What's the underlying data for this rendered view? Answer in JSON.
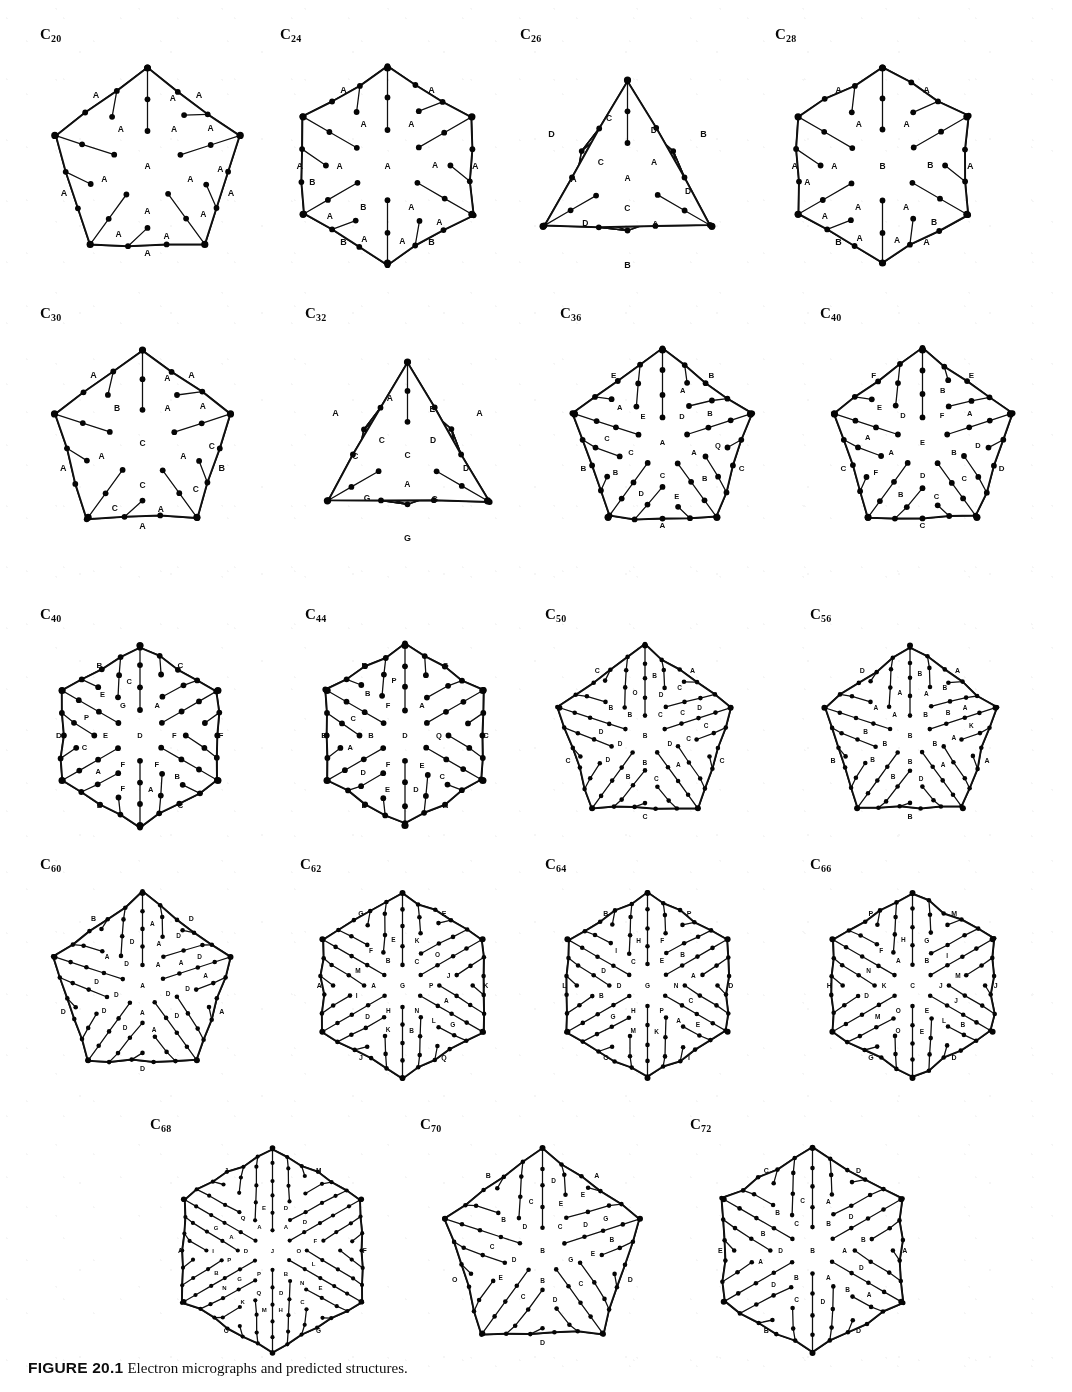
{
  "figure": {
    "caption_number": "FIGURE 20.1",
    "caption_text": "Electron micrographs and predicted structures.",
    "kind": "schlegel-diagram-plate",
    "total_diagrams": 19,
    "page_background": "#ffffff",
    "ink_color": "#141414"
  },
  "rows": [
    {
      "index": 0,
      "cells": [
        {
          "label_prefix": "C",
          "label_sub": "20",
          "name": "c20",
          "outline": "pentagon",
          "rings": 3,
          "seed": 3,
          "face_letters": [
            "A",
            "A",
            "A",
            "A",
            "A",
            "A",
            "A",
            "A",
            "A",
            "A",
            "A",
            "A"
          ],
          "outer_letters": [
            "A",
            "A",
            "A",
            "A",
            "A"
          ],
          "vertices": 20,
          "faces": 12
        },
        {
          "label_prefix": "C",
          "label_sub": "24",
          "name": "c24",
          "outline": "hexagon",
          "rings": 3,
          "seed": 7,
          "face_letters": [
            "A",
            "A",
            "B",
            "A",
            "A",
            "A",
            "A",
            "A",
            "A",
            "A",
            "A",
            "B"
          ],
          "outer_letters": [
            "B",
            "B",
            "A",
            "A",
            "A",
            "A"
          ],
          "vertices": 24,
          "faces": 14
        },
        {
          "label_prefix": "C",
          "label_sub": "26",
          "name": "c26",
          "outline": "triangle",
          "rings": 3,
          "seed": 11,
          "face_letters": [
            "A",
            "A",
            "C",
            "C",
            "D",
            "D",
            "A",
            "D",
            "A",
            "C",
            "B",
            "B"
          ],
          "outer_letters": [
            "B",
            "B",
            "D"
          ],
          "vertices": 26,
          "faces": 15
        },
        {
          "label_prefix": "C",
          "label_sub": "28",
          "name": "c28",
          "outline": "hexagon",
          "rings": 3,
          "seed": 17,
          "face_letters": [
            "B",
            "A",
            "A",
            "A",
            "A",
            "A",
            "B",
            "B",
            "A",
            "A",
            "A",
            "A"
          ],
          "outer_letters": [
            "A",
            "B",
            "A",
            "A",
            "A",
            "A"
          ],
          "vertices": 28,
          "faces": 16
        }
      ]
    },
    {
      "index": 1,
      "cells": [
        {
          "label_prefix": "C",
          "label_sub": "30",
          "name": "c30",
          "outline": "pentagon",
          "rings": 3,
          "seed": 23,
          "face_letters": [
            "C",
            "A",
            "A",
            "C",
            "A",
            "B",
            "A",
            "A",
            "C",
            "C",
            "A",
            "C"
          ],
          "outer_letters": [
            "A",
            "B",
            "A",
            "A",
            "A"
          ],
          "vertices": 30,
          "faces": 17
        },
        {
          "label_prefix": "C",
          "label_sub": "32",
          "name": "c32",
          "outline": "triangle",
          "rings": 3,
          "seed": 29,
          "face_letters": [
            "C",
            "D",
            "A",
            "C",
            "E",
            "D",
            "G",
            "G",
            "C",
            "A",
            "B",
            "F"
          ],
          "outer_letters": [
            "A",
            "G",
            "A"
          ],
          "vertices": 32,
          "faces": 18
        },
        {
          "label_prefix": "C",
          "label_sub": "36",
          "name": "c36",
          "outline": "pentagon",
          "rings": 4,
          "seed": 31,
          "face_letters": [
            "A",
            "D",
            "A",
            "C",
            "C",
            "E",
            "A",
            "B",
            "Q",
            "B",
            "E",
            "D",
            "B",
            "C",
            "A"
          ],
          "outer_letters": [
            "B",
            "C",
            "A",
            "B",
            "E"
          ],
          "vertices": 36,
          "faces": 20
        },
        {
          "label_prefix": "C",
          "label_sub": "40",
          "name": "c40",
          "outline": "pentagon",
          "rings": 4,
          "seed": 37,
          "face_letters": [
            "E",
            "F",
            "B",
            "D",
            "A",
            "D",
            "B",
            "A",
            "D",
            "C",
            "C",
            "B",
            "F",
            "A",
            "E"
          ],
          "outer_letters": [
            "E",
            "D",
            "C",
            "C",
            "F"
          ],
          "vertices": 40,
          "faces": 22
        }
      ]
    },
    {
      "index": 2,
      "cells": [
        {
          "label_prefix": "C",
          "label_sub": "40",
          "name": "c40b",
          "outline": "hexagon",
          "rings": 4,
          "seed": 41,
          "face_letters": [
            "D",
            "F",
            "F",
            "E",
            "G",
            "A",
            "F",
            "B",
            "A",
            "F",
            "A",
            "C",
            "P",
            "E",
            "C"
          ],
          "outer_letters": [
            "C",
            "E",
            "D",
            "B",
            "C",
            "F"
          ],
          "vertices": 40,
          "faces": 22
        },
        {
          "label_prefix": "C",
          "label_sub": "44",
          "name": "c44",
          "outline": "hexagon",
          "rings": 4,
          "seed": 43,
          "face_letters": [
            "D",
            "E",
            "F",
            "B",
            "F",
            "A",
            "Q",
            "C",
            "D",
            "E",
            "D",
            "A",
            "C",
            "B",
            "P"
          ],
          "outer_letters": [
            "A",
            "D",
            "E",
            "B",
            "G",
            "C"
          ],
          "vertices": 44,
          "faces": 24
        },
        {
          "label_prefix": "C",
          "label_sub": "50",
          "name": "c50",
          "outline": "pentagon",
          "rings": 5,
          "seed": 47,
          "face_letters": [
            "B",
            "C",
            "D",
            "B",
            "D",
            "B",
            "D",
            "C",
            "C",
            "A",
            "C",
            "B",
            "D",
            "D",
            "B",
            "O",
            "B",
            "C",
            "D",
            "C"
          ],
          "outer_letters": [
            "A",
            "C",
            "C",
            "C",
            "C"
          ],
          "vertices": 50,
          "faces": 27
        },
        {
          "label_prefix": "C",
          "label_sub": "56",
          "name": "c56",
          "outline": "pentagon",
          "rings": 5,
          "seed": 53,
          "face_letters": [
            "B",
            "B",
            "B",
            "B",
            "B",
            "A",
            "A",
            "B",
            "A",
            "A",
            "D",
            "B",
            "B",
            "B",
            "A",
            "A",
            "B",
            "B",
            "A",
            "K"
          ],
          "outer_letters": [
            "A",
            "A",
            "B",
            "B",
            "D"
          ],
          "vertices": 56,
          "faces": 30
        }
      ]
    },
    {
      "index": 3,
      "cells": [
        {
          "label_prefix": "C",
          "label_sub": "60",
          "name": "c60",
          "outline": "pentagon",
          "rings": 5,
          "seed": 59,
          "face_letters": [
            "A",
            "A",
            "D",
            "A",
            "D",
            "D",
            "A",
            "A",
            "D",
            "D",
            "A",
            "D",
            "D",
            "D",
            "A",
            "D",
            "A",
            "D",
            "D",
            "A"
          ],
          "outer_letters": [
            "D",
            "A",
            "D",
            "D",
            "B"
          ],
          "vertices": 60,
          "faces": 32
        },
        {
          "label_prefix": "C",
          "label_sub": "62",
          "name": "c62",
          "outline": "hexagon",
          "rings": 5,
          "seed": 61,
          "face_letters": [
            "G",
            "N",
            "H",
            "A",
            "B",
            "C",
            "P",
            "L",
            "B",
            "K",
            "D",
            "I",
            "M",
            "F",
            "E",
            "K",
            "O",
            "J",
            "A",
            "G"
          ],
          "outer_letters": [
            "Q",
            "J",
            "A",
            "G",
            "E",
            "K"
          ],
          "vertices": 62,
          "faces": 33
        },
        {
          "label_prefix": "C",
          "label_sub": "64",
          "name": "c64",
          "outline": "hexagon",
          "rings": 5,
          "seed": 67,
          "face_letters": [
            "G",
            "P",
            "H",
            "D",
            "C",
            "E",
            "N",
            "A",
            "K",
            "M",
            "G",
            "B",
            "D",
            "I",
            "H",
            "F",
            "B",
            "A",
            "C",
            "E"
          ],
          "outer_letters": [
            "I",
            "O",
            "L",
            "B",
            "P",
            "D"
          ],
          "vertices": 64,
          "faces": 34
        },
        {
          "label_prefix": "C",
          "label_sub": "66",
          "name": "c66",
          "outline": "hexagon",
          "rings": 5,
          "seed": 71,
          "face_letters": [
            "C",
            "E",
            "O",
            "K",
            "A",
            "B",
            "J",
            "L",
            "E",
            "O",
            "M",
            "D",
            "N",
            "F",
            "H",
            "G",
            "I",
            "M",
            "J",
            "B"
          ],
          "outer_letters": [
            "D",
            "G",
            "H",
            "P",
            "M",
            "J"
          ],
          "vertices": 66,
          "faces": 35
        }
      ]
    },
    {
      "index": 4,
      "cells": [
        {
          "label_prefix": "C",
          "label_sub": "68",
          "name": "c68",
          "outline": "hexagon",
          "rings": 6,
          "seed": 73,
          "face_letters": [
            "J",
            "B",
            "P",
            "D",
            "A",
            "A",
            "O",
            "N",
            "D",
            "Q",
            "G",
            "P",
            "A",
            "Q",
            "E",
            "D",
            "D",
            "F",
            "L",
            "E",
            "C",
            "H",
            "M",
            "K",
            "N",
            "B",
            "I",
            "G"
          ],
          "outer_letters": [
            "G",
            "O",
            "A",
            "J",
            "M",
            "F"
          ],
          "vertices": 68,
          "faces": 36
        },
        {
          "label_prefix": "C",
          "label_sub": "70",
          "name": "c70",
          "outline": "pentagon",
          "rings": 5,
          "seed": 79,
          "face_letters": [
            "B",
            "C",
            "G",
            "B",
            "D",
            "D",
            "E",
            "D",
            "E",
            "C",
            "D",
            "C",
            "E",
            "C",
            "B",
            "C",
            "D",
            "E",
            "G",
            "B"
          ],
          "outer_letters": [
            "A",
            "D",
            "D",
            "O",
            "B"
          ],
          "vertices": 70,
          "faces": 37
        },
        {
          "label_prefix": "C",
          "label_sub": "72",
          "name": "c72",
          "outline": "hexagon",
          "rings": 5,
          "seed": 83,
          "face_letters": [
            "B",
            "A",
            "B",
            "D",
            "C",
            "B",
            "A",
            "B",
            "D",
            "C",
            "D",
            "A",
            "B",
            "B",
            "C",
            "A",
            "D",
            "B",
            "D",
            "A"
          ],
          "outer_letters": [
            "D",
            "B",
            "E",
            "C",
            "D",
            "A"
          ],
          "vertices": 72,
          "faces": 38
        }
      ]
    }
  ]
}
